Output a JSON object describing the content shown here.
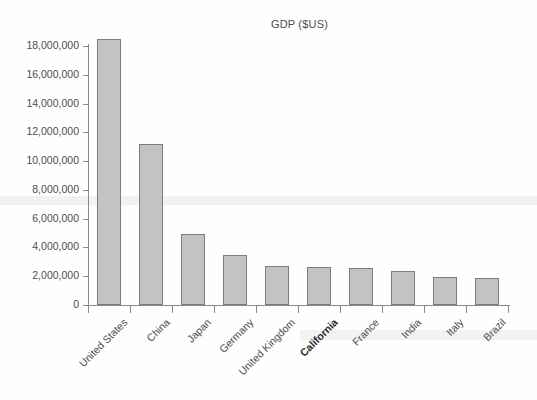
{
  "chart_data": {
    "type": "bar",
    "title": "GDP ($US)",
    "xlabel": "",
    "ylabel": "",
    "categories": [
      "United States",
      "China",
      "Japan",
      "Germany",
      "United Kingdom",
      "California",
      "France",
      "India",
      "Italy",
      "Brazil"
    ],
    "values": [
      18500000,
      11200000,
      4900000,
      3450000,
      2700000,
      2620000,
      2580000,
      2380000,
      1930000,
      1900000
    ],
    "highlight_category": "California",
    "ylim": [
      0,
      18000000
    ],
    "ytick_labels": [
      "18,000,000",
      "16,000,000",
      "14,000,000",
      "12,000,000",
      "10,000,000",
      "8,000,000",
      "6,000,000",
      "4,000,000",
      "2,000,000",
      "0"
    ],
    "ytick_values": [
      18000000,
      16000000,
      14000000,
      12000000,
      10000000,
      8000000,
      6000000,
      4000000,
      2000000,
      0
    ],
    "grid": false,
    "legend": false,
    "series": [
      {
        "name": "GDP ($US)",
        "values": [
          18500000,
          11200000,
          4900000,
          3450000,
          2700000,
          2620000,
          2580000,
          2380000,
          1930000,
          1900000
        ]
      }
    ],
    "colors": {
      "bar_fill": "#c3c3c3",
      "bar_edge": "#7d7d7d",
      "axis": "#8a8a8a",
      "text": "#4d4d4d",
      "background": "#fefefe"
    }
  }
}
